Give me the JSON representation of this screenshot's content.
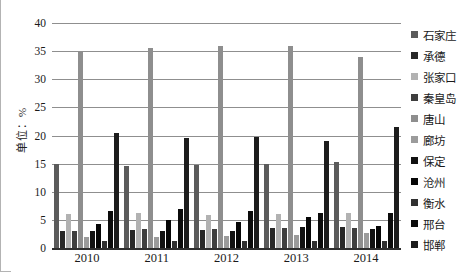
{
  "figure": {
    "y_axis_title": "单位：%"
  },
  "chart_data": {
    "type": "bar",
    "title": "",
    "xlabel": "",
    "ylabel": "单位：%",
    "ylim": [
      0,
      40
    ],
    "yticks": [
      0,
      5,
      10,
      15,
      20,
      25,
      30,
      35,
      40
    ],
    "grid": true,
    "legend_position": "right",
    "categories": [
      "2010",
      "2011",
      "2012",
      "2013",
      "2014"
    ],
    "series": [
      {
        "name": "石家庄",
        "color": "#5b5b5b",
        "values": [
          15.0,
          14.5,
          14.7,
          15.0,
          15.3
        ]
      },
      {
        "name": "承德",
        "color": "#282828",
        "values": [
          3.0,
          3.2,
          3.2,
          3.5,
          3.8
        ]
      },
      {
        "name": "张家口",
        "color": "#b2b2b2",
        "values": [
          6.0,
          6.2,
          5.8,
          6.0,
          6.2
        ]
      },
      {
        "name": "秦皇岛",
        "color": "#3e3e3e",
        "values": [
          3.0,
          3.3,
          3.4,
          3.5,
          3.5
        ]
      },
      {
        "name": "唐山",
        "color": "#8e8e8e",
        "values": [
          35.0,
          35.5,
          36.0,
          36.0,
          34.0
        ]
      },
      {
        "name": "廊坊",
        "color": "#9b9b9b",
        "values": [
          2.0,
          2.0,
          2.2,
          2.3,
          2.6
        ]
      },
      {
        "name": "保定",
        "color": "#111111",
        "values": [
          3.0,
          3.0,
          3.0,
          3.7,
          3.3
        ]
      },
      {
        "name": "沧州",
        "color": "#060606",
        "values": [
          4.3,
          5.0,
          4.7,
          5.5,
          3.9
        ]
      },
      {
        "name": "衡水",
        "color": "#303030",
        "values": [
          1.2,
          1.3,
          1.2,
          1.3,
          1.2
        ]
      },
      {
        "name": "邢台",
        "color": "#0b0b0b",
        "values": [
          6.6,
          7.0,
          6.5,
          6.3,
          6.2
        ]
      },
      {
        "name": "邯郸",
        "color": "#1c1c1c",
        "values": [
          20.5,
          19.5,
          19.7,
          19.0,
          21.5
        ]
      }
    ]
  }
}
